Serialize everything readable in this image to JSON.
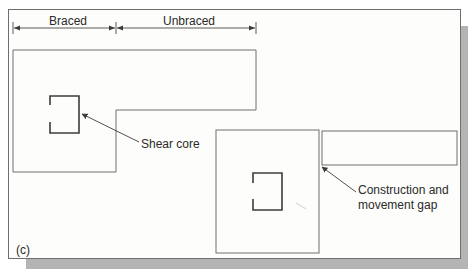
{
  "figure": {
    "panel_label": "(c)",
    "dimension_labels": {
      "braced": "Braced",
      "unbraced": "Unbraced"
    },
    "annotations": {
      "shear_core": "Shear core",
      "gap_line1": "Construction and",
      "gap_line2": "movement gap"
    },
    "colors": {
      "line": "#6e6e6e",
      "core": "#3c3c3c",
      "text": "#2a2a2a",
      "shadow": "#b4b4b4",
      "background": "#fdfdfb"
    }
  }
}
